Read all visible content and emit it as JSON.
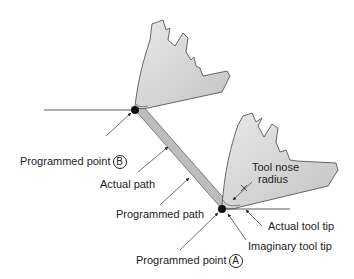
{
  "labels": {
    "programmed_point_b": {
      "text": "Programmed point",
      "marker": "B"
    },
    "actual_path": "Actual path",
    "programmed_path": "Programmed path",
    "tool_nose_radius_1": "Tool nose",
    "tool_nose_radius_2": "radius",
    "actual_tool_tip": "Actual tool tip",
    "imaginary_tool_tip": "Imaginary tool tip",
    "programmed_point_a": {
      "text": "Programmed point",
      "marker": "A"
    }
  },
  "colors": {
    "tool_fill": "#d6d6d6",
    "path_band": "#b8b8b8",
    "line": "#333333"
  }
}
